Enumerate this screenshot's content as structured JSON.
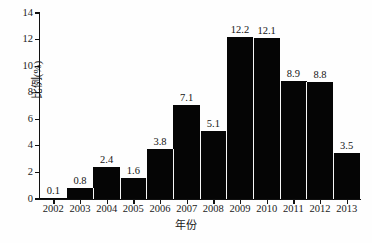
{
  "chart_data": {
    "type": "bar",
    "title": "",
    "xlabel": "年份",
    "ylabel": "比例(%)",
    "categories": [
      "2002",
      "2003",
      "2004",
      "2005",
      "2006",
      "2007",
      "2008",
      "2009",
      "2010",
      "2011",
      "2012",
      "2013"
    ],
    "values": [
      0.1,
      0.8,
      2.4,
      1.6,
      3.8,
      7.1,
      5.1,
      12.2,
      12.1,
      8.9,
      8.8,
      3.5
    ],
    "value_labels": [
      "0.1",
      "0.8",
      "2.4",
      "1.6",
      "3.8",
      "7.1",
      "5.1",
      "12.2",
      "12.1",
      "8.9",
      "8.8",
      "3.5"
    ],
    "ylim": [
      0,
      14
    ],
    "ytick_labels": [
      "0",
      "2",
      "4",
      "6",
      "8",
      "10",
      "12",
      "14"
    ],
    "ytick_values": [
      0,
      2,
      4,
      6,
      8,
      10,
      12,
      14
    ],
    "grid": false,
    "legend": false,
    "bar_color": "#050505",
    "background_color": "#fefefe",
    "axis_color": "#111111"
  }
}
